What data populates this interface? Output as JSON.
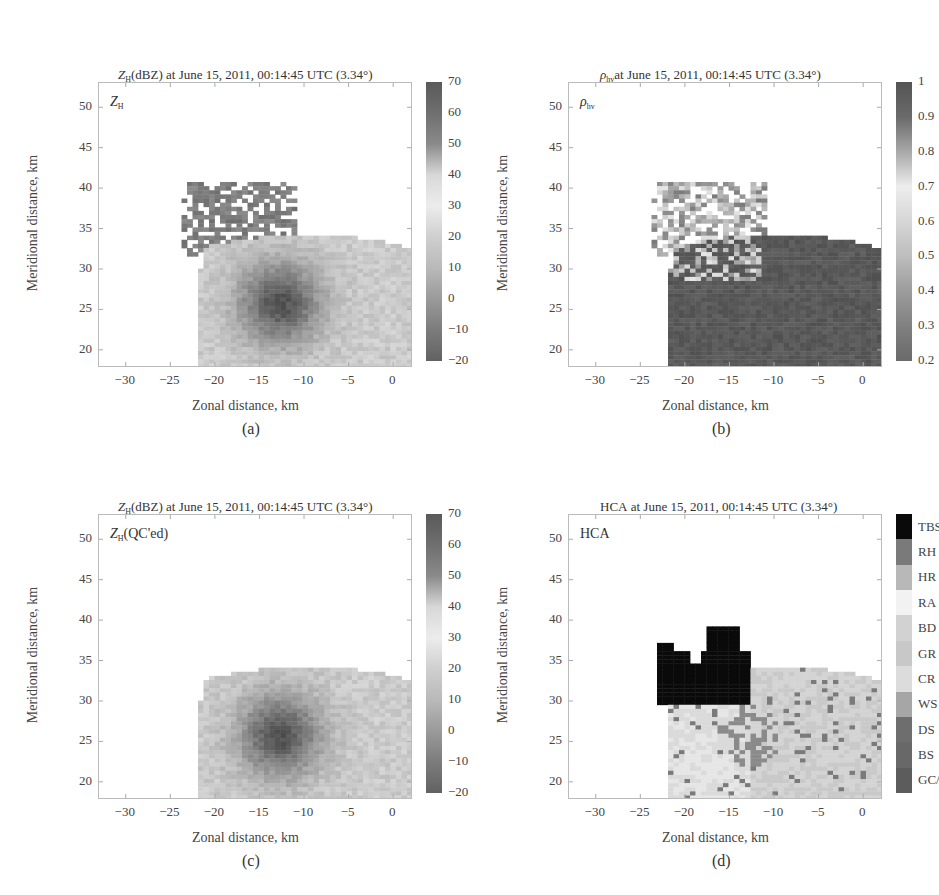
{
  "figure": {
    "page_header_fragment": "pp",
    "panels": [
      {
        "id": "a",
        "title_symbol": "Z",
        "title_sub": "H",
        "title_rest": "(dBZ) at June 15, 2011, 00:14:45 UTC (3.34°)",
        "inner_label_symbol": "Z",
        "inner_label_sub": "H",
        "inner_label_rest": "",
        "xlabel": "Zonal distance, km",
        "ylabel": "Meridional distance, km",
        "caption": "(a)",
        "xticks": [
          "−30",
          "−25",
          "−20",
          "−15",
          "−10",
          "−5",
          "0"
        ],
        "yticks": [
          "50",
          "45",
          "40",
          "35",
          "30",
          "25",
          "20"
        ],
        "colorbar_ticks": [
          "70",
          "60",
          "50",
          "40",
          "30",
          "20",
          "10",
          "0",
          "−10",
          "−20"
        ]
      },
      {
        "id": "b",
        "title_symbol": "ρ",
        "title_sub": "hv",
        "title_rest": "at June 15, 2011, 00:14:45 UTC (3.34°)",
        "inner_label_symbol": "ρ",
        "inner_label_sub": "hv",
        "inner_label_rest": "",
        "xlabel": "Zonal distance, km",
        "ylabel": "Meridional distance, km",
        "caption": "(b)",
        "xticks": [
          "−30",
          "−25",
          "−20",
          "−15",
          "−10",
          "−5",
          "0"
        ],
        "yticks": [
          "50",
          "45",
          "40",
          "35",
          "30",
          "25",
          "20"
        ],
        "colorbar_ticks": [
          "1",
          "0.9",
          "0.8",
          "0.7",
          "0.6",
          "0.5",
          "0.4",
          "0.3",
          "0.2"
        ]
      },
      {
        "id": "c",
        "title_symbol": "Z",
        "title_sub": "H",
        "title_rest": "(dBZ) at June 15, 2011, 00:14:45 UTC (3.34°)",
        "inner_label_symbol": "Z",
        "inner_label_sub": "H",
        "inner_label_rest": "(QC'ed)",
        "xlabel": "Zonal distance, km",
        "ylabel": "Meridional distance, km",
        "caption": "(c)",
        "xticks": [
          "−30",
          "−25",
          "−20",
          "−15",
          "−10",
          "−5",
          "0"
        ],
        "yticks": [
          "50",
          "45",
          "40",
          "35",
          "30",
          "25",
          "20"
        ],
        "colorbar_ticks": [
          "70",
          "60",
          "50",
          "40",
          "30",
          "20",
          "10",
          "0",
          "−10",
          "−20"
        ]
      },
      {
        "id": "d",
        "title_symbol": "HCA",
        "title_sub": "",
        "title_rest": " at June 15, 2011, 00:14:45 UTC (3.34°)",
        "inner_label_symbol": "HCA",
        "inner_label_sub": "",
        "inner_label_rest": "",
        "xlabel": "Zonal distance, km",
        "ylabel": "Meridional distance, km",
        "caption": "(d)",
        "xticks": [
          "−30",
          "−25",
          "−20",
          "−15",
          "−10",
          "−5",
          "0"
        ],
        "yticks": [
          "50",
          "45",
          "40",
          "35",
          "30",
          "25",
          "20"
        ],
        "colorbar_ticks": [
          "TBSS",
          "RH",
          "HR",
          "RA",
          "BD",
          "GR",
          "CR",
          "WS",
          "DS",
          "BS",
          "GC/AP"
        ]
      }
    ],
    "colors": {
      "zh_scale": [
        "#5a5a5a",
        "#6f6f6f",
        "#8a8a8a",
        "#d8d8d8",
        "#ececec",
        "#cfcfcf",
        "#b9b9b9",
        "#9a9a9a",
        "#7c7c7c",
        "#626262"
      ],
      "rho_scale": [
        "#545454",
        "#6a6a6a",
        "#a8a8a8",
        "#ededed",
        "#d6d6d6",
        "#bdbdbd",
        "#9c9c9c",
        "#808080",
        "#6a6a6a"
      ],
      "hca_classes": {
        "TBSS": "#0a0a0a",
        "RH": "#7a7a7a",
        "HR": "#b8b8b8",
        "RA": "#f2f2f2",
        "BD": "#d2d2d2",
        "GR": "#c8c8c8",
        "CR": "#dcdcdc",
        "WS": "#a6a6a6",
        "DS": "#6e6e6e",
        "BS": "#686868",
        "GC/AP": "#5c5c5c"
      }
    }
  },
  "chart_data": [
    {
      "type": "heatmap",
      "panel": "(a)",
      "title": "Z_H(dBZ) at June 15, 2011, 00:14:45 UTC (3.34°)",
      "xlabel": "Zonal distance, km",
      "ylabel": "Meridional distance, km",
      "xlim": [
        -33,
        2
      ],
      "ylim": [
        18,
        53
      ],
      "xticks": [
        -30,
        -25,
        -20,
        -15,
        -10,
        -5,
        0
      ],
      "yticks": [
        20,
        25,
        30,
        35,
        40,
        45,
        50
      ],
      "colorbar": {
        "label": "Z_H (dBZ)",
        "range": [
          -20,
          70
        ],
        "ticks": [
          -20,
          -10,
          0,
          10,
          20,
          30,
          40,
          50,
          60,
          70
        ]
      },
      "annotation": "Z_H",
      "description": "Echo region in lower right quadrant; core of high reflectivity (~50-60 dBZ) centered near (-13, 25); low-reflectivity (~-10 dBZ) speckle to the northwest near (-20 to -12, 34-42)."
    },
    {
      "type": "heatmap",
      "panel": "(b)",
      "title": "ρ_hv at June 15, 2011, 00:14:45 UTC (3.34°)",
      "xlabel": "Zonal distance, km",
      "ylabel": "Meridional distance, km",
      "xlim": [
        -33,
        2
      ],
      "ylim": [
        18,
        53
      ],
      "xticks": [
        -30,
        -25,
        -20,
        -15,
        -10,
        -5,
        0
      ],
      "yticks": [
        20,
        25,
        30,
        35,
        40,
        45,
        50
      ],
      "colorbar": {
        "label": "ρ_hv",
        "range": [
          0.2,
          1.0
        ],
        "ticks": [
          0.2,
          0.3,
          0.4,
          0.5,
          0.6,
          0.7,
          0.8,
          0.9,
          1.0
        ]
      },
      "annotation": "ρ_hv",
      "description": "High correlation (~0.98-1) over main precipitation region; noisy low values (0.5-0.8) in northwest fringe near (-22 to -12, 32-42)."
    },
    {
      "type": "heatmap",
      "panel": "(c)",
      "title": "Z_H(dBZ) at June 15, 2011, 00:14:45 UTC (3.34°)",
      "xlabel": "Zonal distance, km",
      "ylabel": "Meridional distance, km",
      "xlim": [
        -33,
        2
      ],
      "ylim": [
        18,
        53
      ],
      "xticks": [
        -30,
        -25,
        -20,
        -15,
        -10,
        -5,
        0
      ],
      "yticks": [
        20,
        25,
        30,
        35,
        40,
        45,
        50
      ],
      "colorbar": {
        "label": "Z_H (dBZ)",
        "range": [
          -20,
          70
        ],
        "ticks": [
          -20,
          -10,
          0,
          10,
          20,
          30,
          40,
          50,
          60,
          70
        ]
      },
      "annotation": "Z_H(QC'ed)",
      "description": "Quality-controlled reflectivity; northwest non-meteorological echoes removed, leaving precipitation core near (-13, 25)."
    },
    {
      "type": "heatmap",
      "panel": "(d)",
      "title": "HCA at June 15, 2011, 00:14:45 UTC (3.34°)",
      "xlabel": "Zonal distance, km",
      "ylabel": "Meridional distance, km",
      "xlim": [
        -33,
        2
      ],
      "ylim": [
        18,
        53
      ],
      "xticks": [
        -30,
        -25,
        -20,
        -15,
        -10,
        -5,
        0
      ],
      "yticks": [
        20,
        25,
        30,
        35,
        40,
        45,
        50
      ],
      "colorbar": {
        "label": "Hydrometeor class",
        "categories": [
          "TBSS",
          "RH",
          "HR",
          "RA",
          "BD",
          "GR",
          "CR",
          "WS",
          "DS",
          "BS",
          "GC/AP"
        ]
      },
      "annotation": "HCA",
      "description": "TBSS (black) region in northwest near (-23 to -13, 30-40); remaining echo classified mostly as RA/BD/GR with patches of RH/WS."
    }
  ]
}
